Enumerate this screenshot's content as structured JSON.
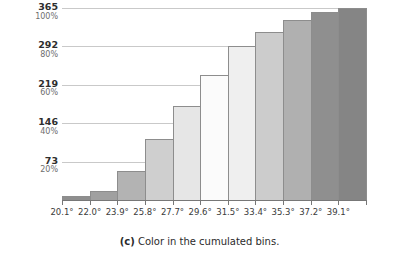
{
  "caption": {
    "label": "(c)",
    "text": " Color in the cumulated bins."
  },
  "chart_data": {
    "type": "bar",
    "title": "",
    "xlabel": "",
    "ylabel": "",
    "grid": true,
    "legend": "none",
    "categories": [
      "20.1°",
      "22.0°",
      "23.9°",
      "25.8°",
      "27.7°",
      "29.6°",
      "31.5°",
      "33.4°",
      "35.3°",
      "37.2°",
      "39.1°"
    ],
    "values": [
      8,
      18,
      56,
      116,
      178,
      237,
      292,
      320,
      343,
      357,
      365
    ],
    "percent_values": [
      2,
      5,
      15,
      32,
      49,
      65,
      80,
      88,
      94,
      98,
      100
    ],
    "bar_colors": [
      "#8e8e8e",
      "#a0a0a0",
      "#b3b3b3",
      "#cfcfcf",
      "#e6e6e6",
      "#fbfbfb",
      "#efefef",
      "#cccccc",
      "#b0b0b0",
      "#8f8f8f",
      "#858585"
    ],
    "bar_edge_color": "#8d8d8d",
    "ylim": [
      0,
      365
    ],
    "yticks": [
      73,
      146,
      219,
      292,
      365
    ],
    "ytick_percent": [
      "20%",
      "40%",
      "60%",
      "80%",
      "100%"
    ],
    "ytick_labels": [
      "73",
      "146",
      "219",
      "292",
      "365"
    ],
    "grid_color": "#c9c9c9",
    "axis_color": "#777777"
  }
}
